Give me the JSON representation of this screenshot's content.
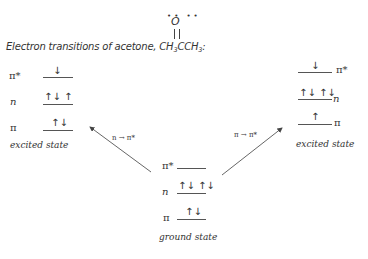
{
  "title": {
    "prefix": "Electron transitions of acetone, CH",
    "sub1": "3",
    "mid": "CCH",
    "sub2": "3",
    "suffix": ":"
  },
  "molecule": {
    "oxygen": "O",
    "lone_pair_dots": "•• ••",
    "bond": "double"
  },
  "diagram": {
    "left_excited": {
      "caption": "excited state",
      "levels": [
        {
          "label": "π*",
          "electrons": "↓"
        },
        {
          "label": "n",
          "electrons": "↑↓ ↑"
        },
        {
          "label": "π",
          "electrons": "↑↓"
        }
      ]
    },
    "right_excited": {
      "caption": "excited state",
      "levels": [
        {
          "label": "π*",
          "electrons": "↓"
        },
        {
          "label": "n",
          "electrons": "↑↓ ↑↓"
        },
        {
          "label": "π",
          "electrons": "↑"
        }
      ]
    },
    "ground": {
      "caption": "ground state",
      "levels": [
        {
          "label": "π*",
          "electrons": ""
        },
        {
          "label": "n",
          "electrons": "↑↓ ↑↓"
        },
        {
          "label": "π",
          "electrons": "↑↓"
        }
      ]
    },
    "transitions": [
      {
        "label": "n → π*",
        "direction": "ground-to-left"
      },
      {
        "label": "π → π*",
        "direction": "ground-to-right"
      }
    ]
  }
}
